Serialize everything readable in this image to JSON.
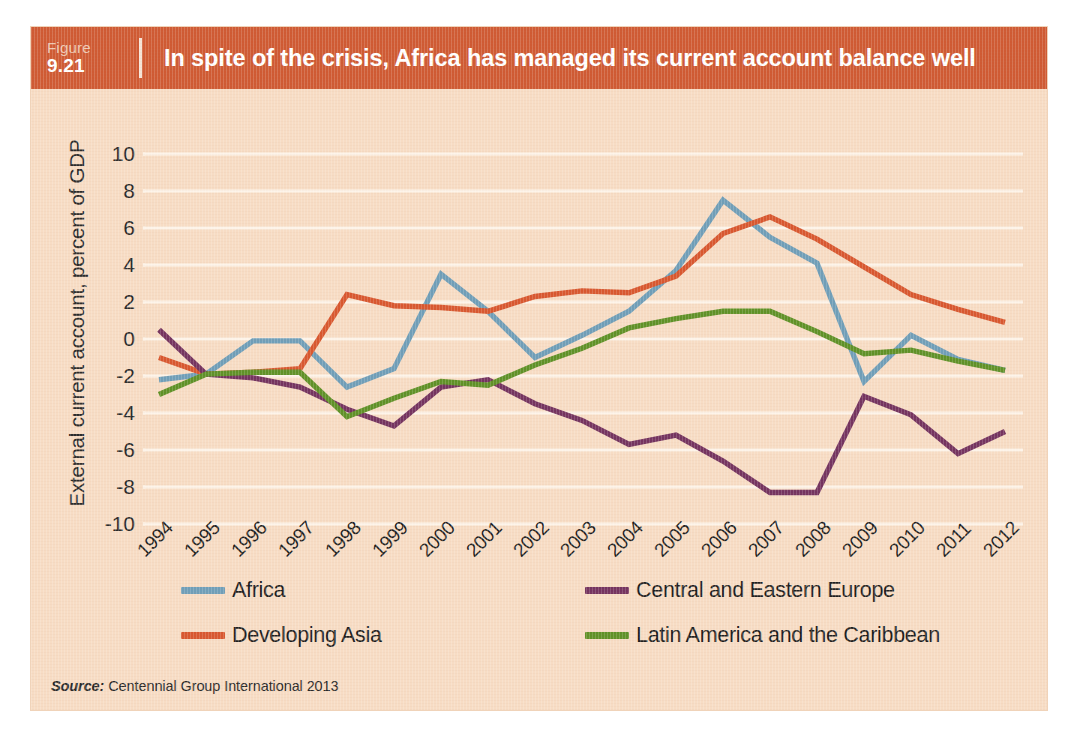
{
  "figure": {
    "label_word": "Figure",
    "number": "9.21",
    "title": "In spite of the crisis, Africa has managed its current account balance well",
    "header_color": "#cf5a33",
    "panel_color": "#f7dcc4"
  },
  "source": {
    "prefix": "Source:",
    "text": "Centennial Group International 2013"
  },
  "legend": {
    "position": "bottom",
    "items": [
      {
        "label": "Africa",
        "color": "#6f9eb8",
        "col": "a",
        "row": 1
      },
      {
        "label": "Central and Eastern Europe",
        "color": "#74335f",
        "col": "b",
        "row": 1
      },
      {
        "label": "Developing Asia",
        "color": "#d8572f",
        "col": "a",
        "row": 2
      },
      {
        "label": "Latin America and the Caribbean",
        "color": "#5f9127",
        "col": "b",
        "row": 2
      }
    ]
  },
  "chart_data": {
    "type": "line",
    "title": "In spite of the crisis, Africa has managed its current account balance well",
    "xlabel": "",
    "ylabel": "External current account, percent of GDP",
    "ylim": [
      -10,
      10
    ],
    "ytick_step": 2,
    "yticks": [
      10,
      8,
      6,
      4,
      2,
      0,
      -2,
      -4,
      -6,
      -8,
      -10
    ],
    "ytick_labels": [
      "10",
      "8",
      "6",
      "4",
      "2",
      "0",
      "-2",
      "-4",
      "-6",
      "-8",
      "-10"
    ],
    "grid": true,
    "grid_color": "#fdf3e8",
    "categories": [
      "1994",
      "1995",
      "1996",
      "1997",
      "1998",
      "1999",
      "2000",
      "2001",
      "2002",
      "2003",
      "2004",
      "2005",
      "2006",
      "2007",
      "2008",
      "2009",
      "2010",
      "2011",
      "2012"
    ],
    "x": [
      1994,
      1995,
      1996,
      1997,
      1998,
      1999,
      2000,
      2001,
      2002,
      2003,
      2004,
      2005,
      2006,
      2007,
      2008,
      2009,
      2010,
      2011,
      2012
    ],
    "series": [
      {
        "name": "Africa",
        "color": "#6f9eb8",
        "values": [
          -2.2,
          -1.9,
          -0.1,
          -0.1,
          -2.6,
          -1.6,
          3.5,
          1.5,
          -1.0,
          0.2,
          1.5,
          3.7,
          7.5,
          5.5,
          4.1,
          -2.3,
          0.2,
          -1.1,
          -1.7
        ]
      },
      {
        "name": "Developing Asia",
        "color": "#d8572f",
        "values": [
          -1.0,
          -1.9,
          -1.8,
          -1.6,
          2.4,
          1.8,
          1.7,
          1.5,
          2.3,
          2.6,
          2.5,
          3.4,
          5.7,
          6.6,
          5.4,
          3.9,
          2.4,
          1.6,
          0.9
        ]
      },
      {
        "name": "Central and Eastern Europe",
        "color": "#74335f",
        "values": [
          0.5,
          -1.9,
          -2.1,
          -2.6,
          -3.8,
          -4.7,
          -2.6,
          -2.2,
          -3.5,
          -4.4,
          -5.7,
          -5.2,
          -6.6,
          -8.3,
          -8.3,
          -3.1,
          -4.1,
          -6.2,
          -5.0
        ]
      },
      {
        "name": "Latin America and the Caribbean",
        "color": "#5f9127",
        "values": [
          -3.0,
          -1.9,
          -1.8,
          -1.8,
          -4.2,
          -3.2,
          -2.3,
          -2.5,
          -1.4,
          -0.5,
          0.6,
          1.1,
          1.5,
          1.5,
          0.4,
          -0.8,
          -0.6,
          -1.2,
          -1.7
        ]
      }
    ]
  }
}
